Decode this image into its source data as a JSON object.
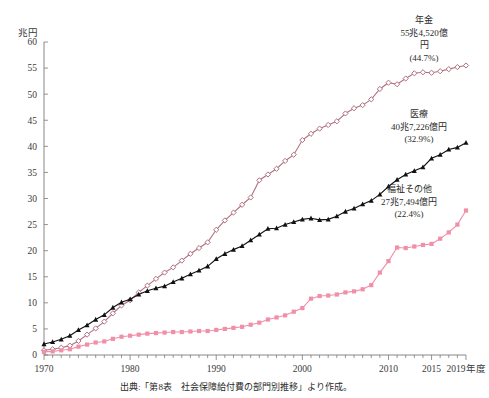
{
  "chart_data": {
    "type": "line",
    "title": "",
    "ylabel": "兆円",
    "xlabel": "",
    "ylim": [
      0,
      60
    ],
    "ytick_step": 5,
    "yticks": [
      "0",
      "5",
      "10",
      "15",
      "20",
      "25",
      "30",
      "35",
      "40",
      "45",
      "50",
      "55",
      "60"
    ],
    "xlim": [
      1970,
      2019
    ],
    "xticks": [
      1970,
      1980,
      1990,
      2000,
      2010,
      2015,
      2019
    ],
    "xtick_labels": [
      "1970",
      "1980",
      "1990",
      "2000",
      "2010",
      "2015",
      "2019年度"
    ],
    "grid": false,
    "legend_position": "inline-annotations",
    "x": [
      1970,
      1971,
      1972,
      1973,
      1974,
      1975,
      1976,
      1977,
      1978,
      1979,
      1980,
      1981,
      1982,
      1983,
      1984,
      1985,
      1986,
      1987,
      1988,
      1989,
      1990,
      1991,
      1992,
      1993,
      1994,
      1995,
      1996,
      1997,
      1998,
      1999,
      2000,
      2001,
      2002,
      2003,
      2004,
      2005,
      2006,
      2007,
      2008,
      2009,
      2010,
      2011,
      2012,
      2013,
      2014,
      2015,
      2016,
      2017,
      2018,
      2019
    ],
    "series": [
      {
        "name": "年金",
        "color": "#b0707f",
        "marker": "open-diamond",
        "values": [
          0.9,
          1.1,
          1.4,
          1.8,
          2.7,
          3.9,
          5.1,
          6.4,
          8.0,
          9.5,
          10.5,
          12.0,
          13.3,
          14.6,
          15.8,
          16.8,
          18.1,
          19.4,
          20.5,
          21.6,
          24.0,
          25.8,
          27.3,
          28.8,
          30.2,
          33.5,
          34.6,
          35.7,
          37.2,
          38.4,
          41.2,
          42.4,
          43.4,
          44.1,
          44.8,
          46.3,
          47.3,
          47.9,
          49.0,
          51.0,
          52.2,
          51.9,
          53.0,
          54.0,
          54.2,
          54.1,
          54.4,
          54.8,
          55.2,
          55.5
        ]
      },
      {
        "name": "医療",
        "color": "#111111",
        "marker": "filled-triangle",
        "values": [
          2.1,
          2.5,
          3.0,
          3.7,
          4.8,
          5.7,
          6.8,
          7.7,
          9.1,
          10.1,
          10.7,
          11.6,
          12.3,
          12.8,
          13.2,
          14.0,
          14.7,
          15.5,
          16.2,
          17.0,
          18.4,
          19.4,
          20.2,
          20.9,
          22.0,
          23.1,
          24.2,
          24.3,
          25.0,
          25.5,
          26.0,
          26.2,
          25.9,
          26.0,
          26.6,
          27.5,
          28.1,
          28.9,
          29.6,
          30.8,
          32.3,
          33.6,
          34.6,
          35.3,
          36.0,
          37.7,
          38.4,
          39.4,
          39.8,
          40.7
        ]
      },
      {
        "name": "福祉その他",
        "color": "#f090a8",
        "marker": "filled-square",
        "values": [
          0.6,
          0.7,
          0.9,
          1.1,
          1.6,
          2.0,
          2.4,
          2.6,
          3.1,
          3.5,
          3.7,
          3.9,
          4.1,
          4.2,
          4.3,
          4.4,
          4.4,
          4.5,
          4.6,
          4.6,
          4.8,
          5.0,
          5.2,
          5.4,
          5.8,
          6.2,
          6.8,
          7.2,
          7.6,
          8.3,
          9.0,
          10.8,
          11.3,
          11.4,
          11.6,
          12.0,
          12.2,
          12.6,
          13.4,
          15.8,
          18.0,
          20.6,
          20.5,
          20.8,
          21.1,
          21.3,
          22.3,
          23.5,
          25.0,
          27.7
        ]
      }
    ],
    "annotations": [
      {
        "name": "pension-annotation",
        "lines": [
          "年金",
          "55兆4,520億",
          "円",
          "(44.7%)"
        ]
      },
      {
        "name": "medical-annotation",
        "lines": [
          "医療",
          "40兆7,226億円",
          "(32.9%)"
        ]
      },
      {
        "name": "welfare-annotation",
        "lines": [
          "福祉その他",
          "27兆7,494億円",
          "(22.4%)"
        ]
      }
    ],
    "source_note": "出典:「第8表　社会保障給付費の部門別推移」より作成。"
  }
}
